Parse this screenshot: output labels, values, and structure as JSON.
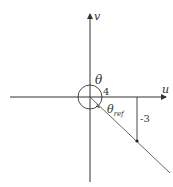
{
  "diagram": {
    "type": "coordinate-plane-angle",
    "axes": {
      "horizontal_label": "u",
      "vertical_label": "v"
    },
    "angle_label": "θ",
    "reference_angle": {
      "symbol": "θ",
      "subscript": "ref"
    },
    "point": {
      "u": 4,
      "v": -3
    },
    "labels": {
      "horizontal_leg": "4",
      "vertical_leg": "-3"
    },
    "colors": {
      "line": "#333333",
      "ray": "#555555",
      "background": "#ffffff"
    }
  }
}
